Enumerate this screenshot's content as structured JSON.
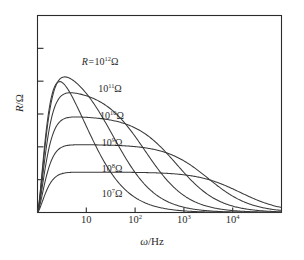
{
  "chart_data": {
    "type": "line",
    "title": "",
    "xlabel": "ω/Hz",
    "ylabel": "R/Ω",
    "x_scale": "log",
    "y_scale": "linear",
    "grid": false,
    "legend_position": "inline-curve-labels",
    "xlim": [
      1,
      100000
    ],
    "ylim": [
      0,
      1
    ],
    "x_ticks": [
      {
        "value": 10,
        "label_mantissa": "10",
        "label_exponent": ""
      },
      {
        "value": 100,
        "label_mantissa": "10",
        "label_exponent": "2"
      },
      {
        "value": 1000,
        "label_mantissa": "10",
        "label_exponent": "3"
      },
      {
        "value": 10000,
        "label_mantissa": "10",
        "label_exponent": "4"
      }
    ],
    "y_ticks_count": 5,
    "y_tick_labels": [],
    "series": [
      {
        "name": "R = 10^12 Ω",
        "label_prefix": "R=",
        "label_mantissa": "10",
        "label_exponent": "12",
        "label_unit": "Ω",
        "plateau_level": 0.93,
        "rolloff_decade": 0.95
      },
      {
        "name": "10^11 Ω",
        "label_prefix": "",
        "label_mantissa": "10",
        "label_exponent": "11",
        "label_unit": "Ω",
        "plateau_level": 0.775,
        "rolloff_decade": 1.55
      },
      {
        "name": "10^10 Ω",
        "label_prefix": "",
        "label_mantissa": "10",
        "label_exponent": "10",
        "label_unit": "Ω",
        "plateau_level": 0.63,
        "rolloff_decade": 2.2
      },
      {
        "name": "10^9 Ω",
        "label_prefix": "",
        "label_mantissa": "10",
        "label_exponent": "9",
        "label_unit": "Ω",
        "plateau_level": 0.49,
        "rolloff_decade": 2.85
      },
      {
        "name": "10^8 Ω",
        "label_prefix": "",
        "label_mantissa": "10",
        "label_exponent": "8",
        "label_unit": "Ω",
        "plateau_level": 0.345,
        "rolloff_decade": 3.5
      },
      {
        "name": "10^7 Ω",
        "label_prefix": "",
        "label_mantissa": "10",
        "label_exponent": "7",
        "label_unit": "Ω",
        "plateau_level": 0.205,
        "rolloff_decade": 4.15
      }
    ],
    "colors": {
      "axis": "#2b2b2b",
      "curve": "#3a3a3a",
      "background": "#ffffff"
    }
  },
  "curve_labels": [
    {
      "prefix": "R=",
      "mantissa": "10",
      "exponent": "12",
      "unit": "Ω"
    },
    {
      "prefix": "",
      "mantissa": "10",
      "exponent": "11",
      "unit": "Ω"
    },
    {
      "prefix": "",
      "mantissa": "10",
      "exponent": "10",
      "unit": "Ω"
    },
    {
      "prefix": "",
      "mantissa": "10",
      "exponent": "9",
      "unit": "Ω"
    },
    {
      "prefix": "",
      "mantissa": "10",
      "exponent": "8",
      "unit": "Ω"
    },
    {
      "prefix": "",
      "mantissa": "10",
      "exponent": "7",
      "unit": "Ω"
    }
  ],
  "axis_titles": {
    "x_var": "ω",
    "x_rest": "/Hz",
    "y_var": "R",
    "y_rest": "/Ω"
  }
}
